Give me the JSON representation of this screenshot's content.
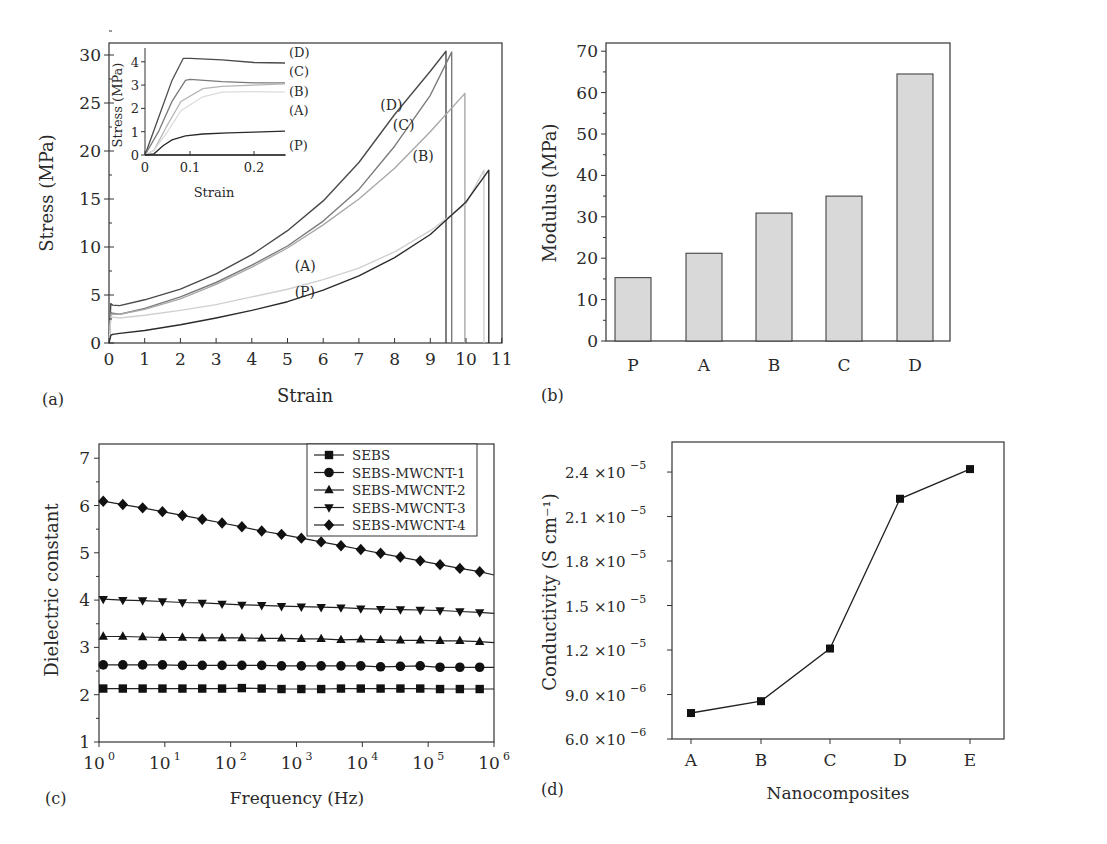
{
  "figure": {
    "panel_labels": [
      "(a)",
      "(b)",
      "(c)",
      "(d)"
    ]
  },
  "chart_data": [
    {
      "id": "a",
      "type": "line",
      "panel_label": "(a)",
      "title": "",
      "xlabel": "Strain",
      "ylabel": "Stress (MPa)",
      "xlim": [
        0,
        11
      ],
      "ylim": [
        0,
        31
      ],
      "xticks": [
        0,
        1,
        2,
        3,
        4,
        5,
        6,
        7,
        8,
        9,
        10,
        11
      ],
      "yticks": [
        0,
        5,
        10,
        15,
        20,
        25,
        30
      ],
      "grid": false,
      "series": [
        {
          "name": "(D)",
          "color": "#4a4a4a",
          "x": [
            0,
            0.05,
            0.1,
            0.3,
            1,
            2,
            3,
            4,
            5,
            6,
            7,
            8,
            9,
            9.44,
            9.44
          ],
          "y": [
            0,
            4.1,
            3.95,
            3.9,
            4.5,
            5.6,
            7.2,
            9.2,
            11.7,
            14.8,
            18.8,
            23.8,
            28.3,
            30.4,
            0
          ]
        },
        {
          "name": "(C)",
          "color": "#7a7a7a",
          "x": [
            0,
            0.05,
            0.1,
            0.3,
            1,
            2,
            3,
            4,
            5,
            6,
            7,
            8,
            9,
            9.6,
            9.6
          ],
          "y": [
            0,
            3.2,
            3.1,
            3.0,
            3.6,
            4.8,
            6.3,
            8.1,
            10.1,
            12.7,
            16.0,
            20.5,
            25.8,
            30.3,
            0
          ]
        },
        {
          "name": "(B)",
          "color": "#a8a8a8",
          "x": [
            0,
            0.05,
            0.1,
            0.3,
            1,
            2,
            3,
            4,
            5,
            6,
            7,
            8,
            9,
            9.97,
            9.97
          ],
          "y": [
            0,
            2.9,
            3.0,
            3.0,
            3.5,
            4.6,
            6.1,
            7.9,
            9.9,
            12.3,
            15.0,
            18.2,
            22.0,
            26.0,
            0
          ]
        },
        {
          "name": "(A)",
          "color": "#d0d0d0",
          "x": [
            0,
            0.05,
            0.1,
            0.3,
            1,
            2,
            3,
            4,
            5,
            6,
            7,
            8,
            9,
            10,
            10.5,
            10.5
          ],
          "y": [
            0,
            2.5,
            2.7,
            2.6,
            2.9,
            3.4,
            4.0,
            4.8,
            5.6,
            6.6,
            7.8,
            9.5,
            11.7,
            14.5,
            18.0,
            0
          ]
        },
        {
          "name": "(P)",
          "color": "#2a2a2a",
          "x": [
            0,
            0.05,
            0.1,
            0.3,
            1,
            2,
            3,
            4,
            5,
            6,
            7,
            8,
            9,
            10,
            10.64,
            10.64
          ],
          "y": [
            0,
            0.8,
            0.9,
            1.0,
            1.3,
            1.9,
            2.6,
            3.4,
            4.3,
            5.5,
            7.0,
            8.9,
            11.3,
            14.7,
            18.0,
            0
          ]
        }
      ],
      "annotations": [
        {
          "text": "(D)",
          "x": 7.6,
          "y": 24.3
        },
        {
          "text": "(C)",
          "x": 7.95,
          "y": 22.2
        },
        {
          "text": "(B)",
          "x": 8.5,
          "y": 19.0
        },
        {
          "text": "(A)",
          "x": 5.2,
          "y": 7.5
        },
        {
          "text": "(P)",
          "x": 5.2,
          "y": 4.8
        }
      ],
      "inset": {
        "xlabel": "Strain",
        "ylabel": "Stress (MPa)",
        "xlim": [
          0,
          0.25
        ],
        "ylim": [
          0,
          4.4
        ],
        "xticks": [
          0,
          0.1,
          0.2
        ],
        "xtick_labels": [
          "0",
          "0.1",
          "0.2"
        ],
        "yticks": [
          0,
          1,
          2,
          3,
          4
        ],
        "series": [
          {
            "name": "(D)",
            "color": "#4a4a4a",
            "x": [
              0,
              0.03,
              0.06,
              0.085,
              0.1,
              0.15,
              0.2,
              0.25
            ],
            "y": [
              0,
              1.6,
              3.2,
              4.15,
              4.15,
              4.08,
              3.97,
              3.95
            ]
          },
          {
            "name": "(C)",
            "color": "#7a7a7a",
            "x": [
              0,
              0.03,
              0.06,
              0.09,
              0.1,
              0.15,
              0.2,
              0.25
            ],
            "y": [
              0,
              1.0,
              2.3,
              3.2,
              3.25,
              3.15,
              3.1,
              3.1
            ]
          },
          {
            "name": "(B)",
            "color": "#b5b5b5",
            "x": [
              0,
              0.02,
              0.05,
              0.08,
              0.12,
              0.15,
              0.2,
              0.25
            ],
            "y": [
              0,
              0.2,
              1.3,
              2.3,
              2.85,
              2.95,
              3.0,
              3.05
            ]
          },
          {
            "name": "(A)",
            "color": "#dcdcdc",
            "x": [
              0,
              0.02,
              0.05,
              0.08,
              0.12,
              0.15,
              0.2,
              0.25
            ],
            "y": [
              0,
              0.2,
              1.0,
              1.9,
              2.5,
              2.7,
              2.72,
              2.7
            ]
          },
          {
            "name": "(P)",
            "color": "#2a2a2a",
            "x": [
              0,
              0.02,
              0.04,
              0.06,
              0.09,
              0.12,
              0.16,
              0.2,
              0.25
            ],
            "y": [
              0,
              0.05,
              0.4,
              0.65,
              0.82,
              0.9,
              0.95,
              0.98,
              1.02
            ]
          },
          {
            "name": "(P-base)",
            "color": "#2a2a2a",
            "x": [
              0,
              0.25
            ],
            "y": [
              0,
              0
            ]
          }
        ],
        "labels": [
          "(D)",
          "(C)",
          "(B)",
          "(A)",
          "(P)"
        ]
      }
    },
    {
      "id": "b",
      "type": "bar",
      "panel_label": "(b)",
      "title": "",
      "xlabel": "",
      "ylabel": "Modulus (MPa)",
      "categories": [
        "P",
        "A",
        "B",
        "C",
        "D"
      ],
      "values": [
        15.3,
        21.2,
        30.9,
        35.0,
        64.5
      ],
      "ylim": [
        0,
        72
      ],
      "yticks": [
        0,
        10,
        20,
        30,
        40,
        50,
        60,
        70
      ],
      "bar_color": "#d9d9d9",
      "grid": false
    },
    {
      "id": "c",
      "type": "line",
      "panel_label": "(c)",
      "title": "",
      "xlabel": "Frequency (Hz)",
      "ylabel": "Dielectric constant",
      "xscale": "log",
      "xlim": [
        1,
        1000000
      ],
      "ylim": [
        1,
        7.3
      ],
      "xtick_exponents": [
        0,
        1,
        2,
        3,
        4,
        5,
        6
      ],
      "yticks": [
        1,
        2,
        3,
        4,
        5,
        6,
        7
      ],
      "legend_position": "upper right",
      "grid": false,
      "x": [
        1.16,
        2.3,
        4.6,
        9.2,
        18.5,
        37,
        74,
        148,
        296,
        592,
        1184,
        2368,
        4736,
        9472,
        18944,
        37888,
        75776,
        151552,
        303104,
        606208
      ],
      "series": [
        {
          "name": "SEBS",
          "marker": "square",
          "values": [
            2.13,
            2.13,
            2.13,
            2.13,
            2.13,
            2.13,
            2.13,
            2.14,
            2.13,
            2.12,
            2.12,
            2.12,
            2.13,
            2.13,
            2.13,
            2.13,
            2.13,
            2.12,
            2.12,
            2.12
          ]
        },
        {
          "name": "SEBS-MWCNT-1",
          "marker": "circle",
          "values": [
            2.63,
            2.63,
            2.63,
            2.63,
            2.62,
            2.62,
            2.62,
            2.62,
            2.62,
            2.61,
            2.61,
            2.61,
            2.61,
            2.61,
            2.59,
            2.6,
            2.61,
            2.58,
            2.58,
            2.58
          ]
        },
        {
          "name": "SEBS-MWCNT-2",
          "marker": "triangle-up",
          "values": [
            3.23,
            3.23,
            3.22,
            3.21,
            3.21,
            3.2,
            3.2,
            3.2,
            3.19,
            3.19,
            3.18,
            3.18,
            3.16,
            3.17,
            3.16,
            3.15,
            3.15,
            3.14,
            3.14,
            3.12
          ]
        },
        {
          "name": "SEBS-MWCNT-3",
          "marker": "triangle-down",
          "values": [
            4.02,
            4.0,
            3.99,
            3.97,
            3.95,
            3.94,
            3.92,
            3.9,
            3.89,
            3.87,
            3.86,
            3.85,
            3.84,
            3.82,
            3.81,
            3.8,
            3.79,
            3.78,
            3.76,
            3.74
          ]
        },
        {
          "name": "SEBS-MWCNT-4",
          "marker": "diamond",
          "values": [
            6.09,
            6.02,
            5.95,
            5.87,
            5.79,
            5.71,
            5.63,
            5.55,
            5.46,
            5.39,
            5.31,
            5.23,
            5.15,
            5.07,
            4.99,
            4.91,
            4.83,
            4.75,
            4.67,
            4.6
          ]
        }
      ]
    },
    {
      "id": "d",
      "type": "line",
      "panel_label": "(d)",
      "title": "",
      "xlabel": "Nanocomposites",
      "ylabel": "Conductivity (S cm⁻¹)",
      "categories": [
        "A",
        "B",
        "C",
        "D",
        "E"
      ],
      "values": [
        7.75e-06,
        8.55e-06,
        1.21e-05,
        2.22e-05,
        2.42e-05
      ],
      "ylim": [
        6e-06,
        2.6e-05
      ],
      "yticks": [
        6e-06,
        9e-06,
        1.2e-05,
        1.5e-05,
        1.8e-05,
        2.1e-05,
        2.4e-05
      ],
      "ytick_labels": [
        {
          "mant": "6.0",
          "exp": "−6"
        },
        {
          "mant": "9.0",
          "exp": "−6"
        },
        {
          "mant": "1.2",
          "exp": "−5"
        },
        {
          "mant": "1.5",
          "exp": "−5"
        },
        {
          "mant": "1.8",
          "exp": "−5"
        },
        {
          "mant": "2.1",
          "exp": "−5"
        },
        {
          "mant": "2.4",
          "exp": "−5"
        }
      ],
      "marker": "square",
      "grid": false
    }
  ]
}
